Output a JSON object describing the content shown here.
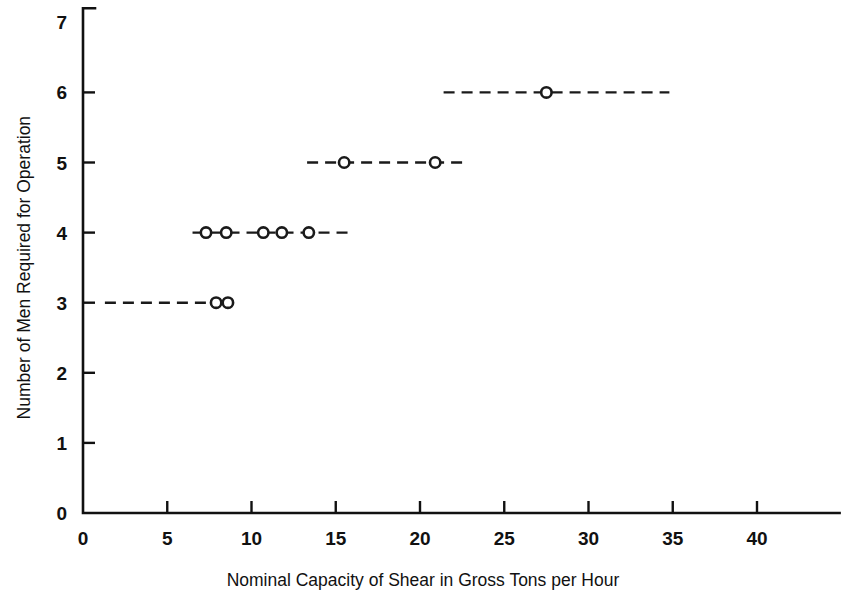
{
  "chart_data": {
    "type": "line",
    "title": "",
    "xlabel": "Nominal Capacity of Shear in Gross Tons per Hour",
    "ylabel": "Number of Men Required for Operation",
    "xlim": [
      0,
      44.9
    ],
    "ylim": [
      0,
      7
    ],
    "xticks": [
      0,
      5,
      10,
      15,
      20,
      25,
      30,
      35,
      40
    ],
    "yticks": [
      0,
      1,
      2,
      3,
      4,
      5,
      6,
      7
    ],
    "xtick_labels": [
      "0",
      "5",
      "10",
      "15",
      "20",
      "25",
      "30",
      "35",
      "40"
    ],
    "ytick_labels": [
      "0",
      "1",
      "2",
      "3",
      "4",
      "5",
      "6",
      "7"
    ],
    "grid": false,
    "legend": "none",
    "line_style": "dashed",
    "marker_style": "open-circle",
    "series": [
      {
        "name": "3 men",
        "level": 3,
        "segment_start": 1.3,
        "segment_end": 8.9,
        "values": [
          7.9,
          8.6
        ]
      },
      {
        "name": "4 men",
        "level": 4,
        "segment_start": 6.5,
        "segment_end": 16.0,
        "values": [
          7.3,
          8.5,
          10.7,
          11.8,
          13.4
        ]
      },
      {
        "name": "5 men",
        "level": 5,
        "segment_start": 13.3,
        "segment_end": 22.7,
        "values": [
          15.5,
          20.9
        ]
      },
      {
        "name": "6 men",
        "level": 6,
        "segment_start": 21.4,
        "segment_end": 34.8,
        "values": [
          27.5
        ]
      }
    ],
    "points": [
      {
        "x": 7.9,
        "y": 3
      },
      {
        "x": 8.6,
        "y": 3
      },
      {
        "x": 7.3,
        "y": 4
      },
      {
        "x": 8.5,
        "y": 4
      },
      {
        "x": 10.7,
        "y": 4
      },
      {
        "x": 11.8,
        "y": 4
      },
      {
        "x": 13.4,
        "y": 4
      },
      {
        "x": 15.5,
        "y": 5
      },
      {
        "x": 20.9,
        "y": 5
      },
      {
        "x": 27.5,
        "y": 6
      }
    ]
  },
  "colors": {
    "background": "#ffffff",
    "ink": "#1a1a1a",
    "axis": "#111111"
  }
}
